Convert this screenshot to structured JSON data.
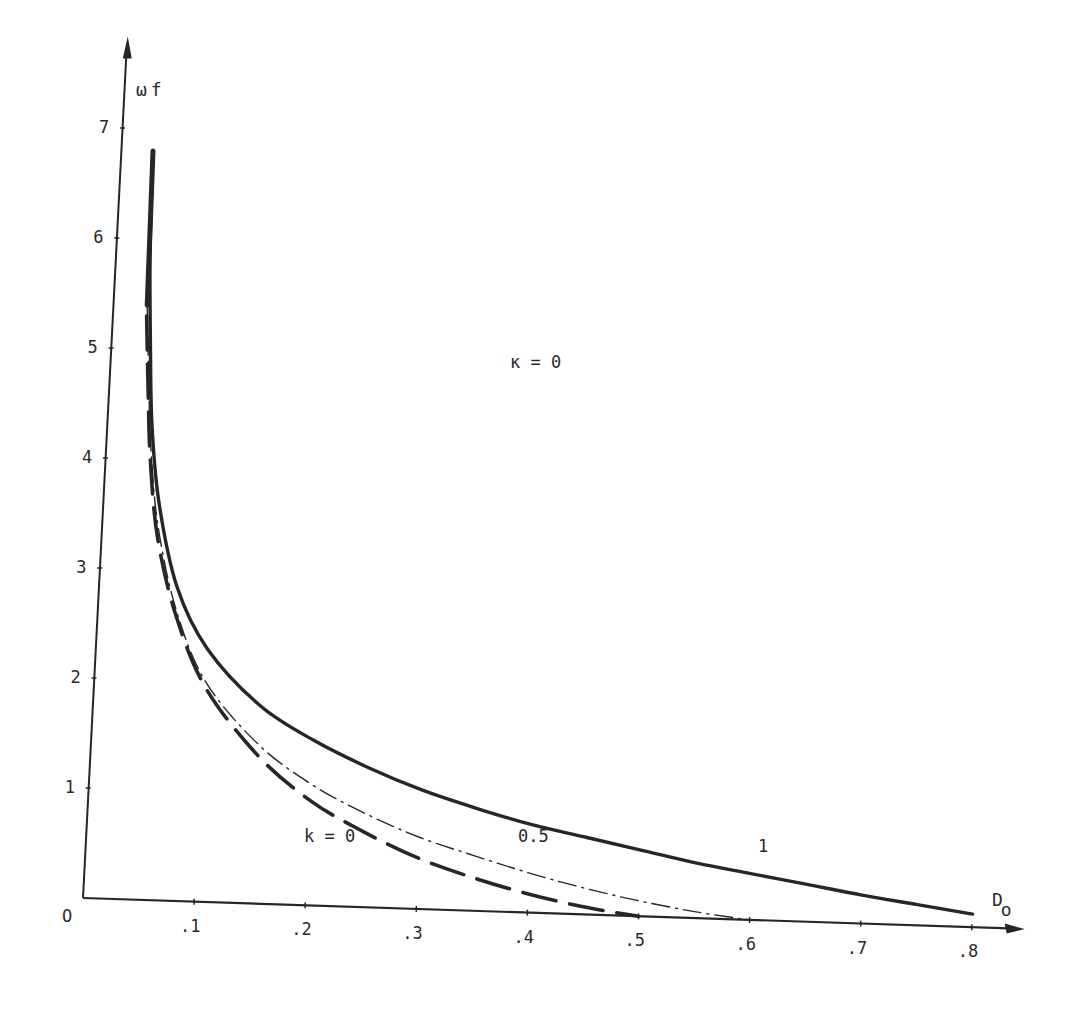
{
  "chart_data": {
    "type": "line",
    "title": "",
    "annotation": "κ = 0",
    "xlabel": "D",
    "xlabel_sub": "o",
    "ylabel": "ω",
    "ylabel_sub": "f",
    "origin_label": "O",
    "xlim": [
      0,
      0.83
    ],
    "ylim": [
      0,
      7.7
    ],
    "x_ticks": [
      ".1",
      ".2",
      ".3",
      ".4",
      ".5",
      ".6",
      ".7",
      ".8"
    ],
    "x_tick_values": [
      0.1,
      0.2,
      0.3,
      0.4,
      0.5,
      0.6,
      0.7,
      0.8
    ],
    "y_ticks": [
      "1",
      "2",
      "3",
      "4",
      "5",
      "6",
      "7"
    ],
    "y_tick_values": [
      1,
      2,
      3,
      4,
      5,
      6,
      7
    ],
    "grid": false,
    "legend": "inline labels",
    "series": [
      {
        "name": "k = 0",
        "label": "k = 0",
        "style": "dashed",
        "x": [
          0.03,
          0.035,
          0.04,
          0.05,
          0.07,
          0.1,
          0.15,
          0.2,
          0.25,
          0.3,
          0.35,
          0.4,
          0.45,
          0.5
        ],
        "y": [
          5.3,
          4.6,
          4.0,
          3.3,
          2.6,
          1.95,
          1.35,
          0.95,
          0.68,
          0.46,
          0.3,
          0.17,
          0.07,
          0.0
        ]
      },
      {
        "name": "k = 0.5",
        "label": "0.5",
        "style": "dash-dot",
        "x": [
          0.03,
          0.035,
          0.04,
          0.05,
          0.07,
          0.1,
          0.15,
          0.2,
          0.25,
          0.3,
          0.35,
          0.4,
          0.45,
          0.5,
          0.55,
          0.6
        ],
        "y": [
          5.4,
          4.7,
          4.1,
          3.4,
          2.65,
          2.0,
          1.45,
          1.1,
          0.85,
          0.65,
          0.5,
          0.36,
          0.24,
          0.14,
          0.06,
          0.0
        ]
      },
      {
        "name": "k = 1",
        "label": "1",
        "style": "solid",
        "x": [
          0.028,
          0.03,
          0.035,
          0.04,
          0.05,
          0.07,
          0.1,
          0.15,
          0.2,
          0.25,
          0.3,
          0.35,
          0.4,
          0.45,
          0.5,
          0.55,
          0.6,
          0.65,
          0.7,
          0.75,
          0.8
        ],
        "y": [
          6.8,
          5.9,
          5.0,
          4.3,
          3.6,
          2.85,
          2.3,
          1.8,
          1.5,
          1.27,
          1.08,
          0.93,
          0.8,
          0.7,
          0.6,
          0.5,
          0.42,
          0.34,
          0.26,
          0.19,
          0.12
        ]
      }
    ]
  }
}
